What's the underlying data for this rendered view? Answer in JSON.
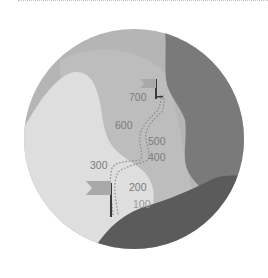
{
  "illustration": {
    "description": "Circular mountain-climb illustration with dotted path and altitude markers",
    "colors": {
      "bg_light_gray": "#b4b4b4",
      "hill_lightest": "#dedede",
      "mid_gray": "#bcbcbc",
      "dark_right": "#7a7a7a",
      "darkest_bottom": "#5a5a5a",
      "flag": "#a9a9a9",
      "text": "#7c7c7c",
      "text_light": "#9a9a9a"
    },
    "altitude_labels": [
      {
        "value": "700"
      },
      {
        "value": "600"
      },
      {
        "value": "500"
      },
      {
        "value": "400"
      },
      {
        "value": "300"
      },
      {
        "value": "200"
      },
      {
        "value": "100"
      }
    ],
    "icons": [
      "start-flag-icon",
      "summit-flag-icon"
    ]
  }
}
